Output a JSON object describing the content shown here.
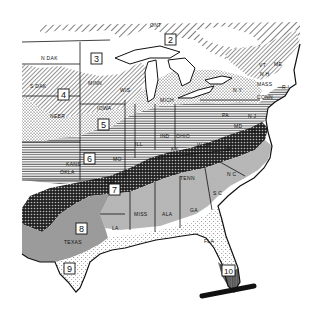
{
  "map": {
    "title": "Plant hardiness zones — eastern United States",
    "colors": {
      "background": "#ffffff",
      "ink": "#111111",
      "zone8_fill": "#9a9a9a",
      "zone10_fill": "#555555",
      "se_fill": "#b5b5b5"
    },
    "zones": [
      {
        "id": "2",
        "label": "2",
        "pattern": "wide-diagonal-hatch"
      },
      {
        "id": "3",
        "label": "3",
        "pattern": "blank"
      },
      {
        "id": "4",
        "label": "4",
        "pattern": "diagonal-hatch"
      },
      {
        "id": "5",
        "label": "5",
        "pattern": "dots"
      },
      {
        "id": "6",
        "label": "6",
        "pattern": "horizontal-lines"
      },
      {
        "id": "7",
        "label": "7",
        "pattern": "dense-crosshatch"
      },
      {
        "id": "8",
        "label": "8",
        "pattern": "gray-tone"
      },
      {
        "id": "9",
        "label": "9",
        "pattern": "light-stipple"
      },
      {
        "id": "10",
        "label": "10",
        "pattern": "dark-vertical-stripe"
      }
    ],
    "state_labels": {
      "ont": "ONT",
      "n_dak": "N DAK",
      "s_dak": "S DAK",
      "minn": "MINN",
      "wis": "WIS",
      "mich": "MICH",
      "nebr": "NEBR",
      "iowa": "IOWA",
      "ill": "ILL",
      "ind": "IND",
      "ohio": "OHIO",
      "kans": "KANS",
      "mo": "MO",
      "okla": "OKLA",
      "ark": "ARK",
      "tenn": "TENN",
      "ky": "KY",
      "w_va": "W VA",
      "va": "VA",
      "pa": "PA",
      "ny": "N Y",
      "me": "ME",
      "nh": "N H",
      "vt": "VT",
      "mass": "MASS",
      "ri": "R I",
      "conn": "CONN",
      "nj": "N J",
      "md": "MD",
      "del": "DEL",
      "nc": "N C",
      "sc": "S C",
      "ga": "GA",
      "ala": "ALA",
      "miss": "MISS",
      "la": "LA",
      "texas": "TEXAS",
      "fla": "FLA"
    }
  }
}
